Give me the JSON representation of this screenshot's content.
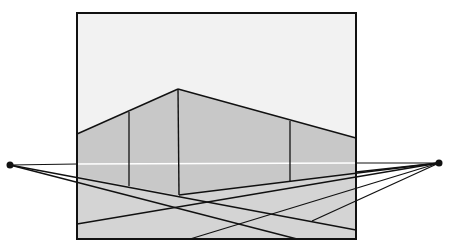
{
  "diagram": {
    "title": "Two-point perspective construction",
    "type": "two-point-perspective",
    "colors": {
      "background": "#ffffff",
      "sky": "#f2f2f2",
      "wall": "#c8c8c8",
      "ground": "#d4d4d4",
      "line": "#111111",
      "horizon_inside": "#ffffff"
    },
    "frame": {
      "x1": 77,
      "y1": 13,
      "x2": 356,
      "y2": 239
    },
    "horizon_y": 164,
    "vanishing_points": [
      {
        "id": "vp-left",
        "x": 10,
        "y": 165
      },
      {
        "id": "vp-right",
        "x": 439,
        "y": 163
      }
    ],
    "building": {
      "apex": {
        "x": 178,
        "y": 89
      },
      "front_corner_bottom": {
        "x": 179,
        "y": 195
      },
      "left_roof_end": {
        "x": 77,
        "y": 134
      },
      "right_roof_end": {
        "x": 356,
        "y": 138
      },
      "verticals": [
        {
          "id": "left-wall-edge",
          "x": 129,
          "y_top": 112,
          "y_bottom": 186
        },
        {
          "id": "front-corner",
          "x": 178,
          "y_top": 89,
          "y_bottom": 195
        },
        {
          "id": "right-wall-edge",
          "x": 290,
          "y_top": 121,
          "y_bottom": 181
        }
      ]
    }
  }
}
